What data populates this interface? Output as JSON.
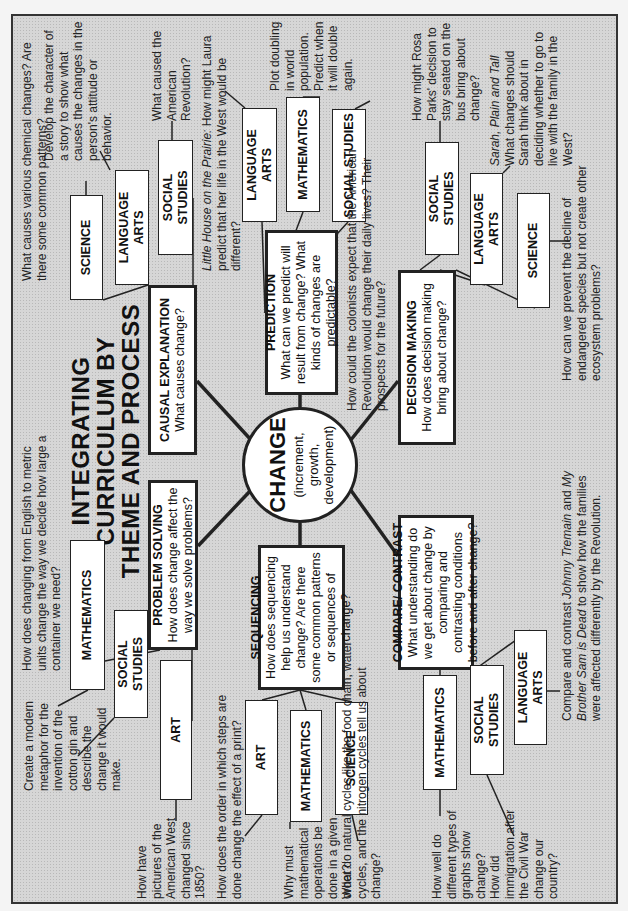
{
  "title": {
    "line1": "INTEGRATING",
    "line2": "CURRICULUM BY",
    "line3": "THEME AND PROCESS"
  },
  "center": {
    "label": "CHANGE",
    "sub1": "(increment, growth,",
    "sub2": "development)"
  },
  "processes": {
    "causal": {
      "title": "CAUSAL EXPLANATION",
      "question": "What causes change?"
    },
    "problem": {
      "title": "PROBLEM SOLVING",
      "question": "How does change affect the way we solve problems?"
    },
    "prediction": {
      "title": "PREDICTION",
      "question": "What can we predict will result from change? What kinds of changes are predictable?"
    },
    "sequencing": {
      "title": "SEQUENCING",
      "question": "How does sequencing help us understand change? Are there some common patterns or sequences of change?"
    },
    "decision": {
      "title": "DECISION MAKING",
      "question": "How does decision making bring about change?"
    },
    "compare": {
      "title": "COMPARE/ CONTRAST",
      "question": "What understanding do we get about change by comparing and contrasting conditions before and after change?"
    }
  },
  "subjects": {
    "causal_science": "SCIENCE",
    "causal_language_arts": "LANGUAGE ARTS",
    "causal_social_studies": "SOCIAL STUDIES",
    "prediction_language_arts": "LANGUAGE ARTS",
    "prediction_mathematics": "MATHEMATICS",
    "prediction_social_studies": "SOCIAL STUDIES",
    "decision_social_studies": "SOCIAL STUDIES",
    "decision_language_arts": "LANGUAGE ARTS",
    "decision_science": "SCIENCE",
    "problem_mathematics": "MATHEMATICS",
    "problem_social_studies": "SOCIAL STUDIES",
    "problem_art": "ART",
    "sequencing_art": "ART",
    "sequencing_mathematics": "MATHEMATICS",
    "sequencing_science": "SCIENCE",
    "compare_mathematics": "MATHEMATICS",
    "compare_social_studies": "SOCIAL STUDIES",
    "compare_language_arts": "LANGUAGE ARTS"
  },
  "notes": {
    "causal_science": "What causes various chemical changes? Are there some common patterns?",
    "causal_language_arts": "Develop the character of a story to show what causes the changes in the person's attitude or behavior.",
    "causal_social_studies": "What caused the American Revolution?",
    "prediction_language_arts_title": "Little House on the Prairie:",
    "prediction_language_arts": "How might Laura predict that her life in the West would be different?",
    "prediction_mathematics": "Plot doubling in world population. Predict when it will double again.",
    "prediction_social_studies": "How could the colonists expect that the American Revolution would change their daily lives? Their prospects for the future?",
    "decision_social_studies": "How might Rosa Parks' decision to stay seated on the bus bring about change?",
    "decision_language_arts_title": "Sarah, Plain and Tall",
    "decision_language_arts": "What changes should Sarah think about in deciding whether to go to live with the family in the West?",
    "decision_science": "How can we prevent the decline of endangered species but not create other ecosystem problems?",
    "problem_mathematics": "How does changing from English to metric units change the way we decide how large a container we need?",
    "problem_social_studies": "Create a modern metaphor for the invention of the cotton gin and describe the change it would make.",
    "problem_art": "How have pictures of the American West changed since 1850?",
    "sequencing_art": "How does the order in which steps are done change the effect of a print?",
    "sequencing_mathematics": "Why must mathematical operations be done in a given order?",
    "sequencing_science": "What do natural cycles like the food chain, water cycles, and the nitrogen cycles tell us about change?",
    "compare_mathematics": "How well do different types of graphs show change?",
    "compare_social_studies": "How did immigration after the Civil War change our country?",
    "compare_language_arts_pre": "Compare and contrast",
    "compare_language_arts_book1": "Johnny Tremain",
    "compare_language_arts_and": "and",
    "compare_language_arts_book2": "My Brother Sam is Dead",
    "compare_language_arts_post": "to show how the families were affected differently by the Revolution."
  }
}
